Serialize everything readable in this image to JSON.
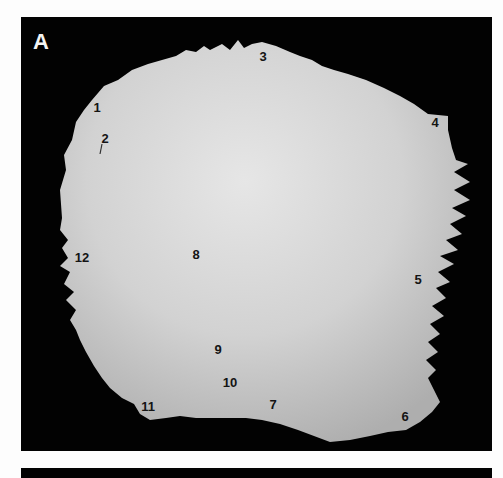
{
  "figure": {
    "panel_label": "A",
    "background_color": "#020202",
    "bone_color": "#cfcfcf",
    "label_color": "#141414",
    "landmarks": [
      {
        "id": "1",
        "x": 97,
        "y": 107
      },
      {
        "id": "2",
        "x": 105,
        "y": 138
      },
      {
        "id": "3",
        "x": 263,
        "y": 56
      },
      {
        "id": "4",
        "x": 435,
        "y": 122
      },
      {
        "id": "5",
        "x": 418,
        "y": 279
      },
      {
        "id": "6",
        "x": 405,
        "y": 416
      },
      {
        "id": "7",
        "x": 273,
        "y": 404
      },
      {
        "id": "8",
        "x": 196,
        "y": 254
      },
      {
        "id": "9",
        "x": 218,
        "y": 349
      },
      {
        "id": "10",
        "x": 230,
        "y": 382
      },
      {
        "id": "11",
        "x": 148,
        "y": 406
      },
      {
        "id": "12",
        "x": 82,
        "y": 257
      }
    ]
  }
}
